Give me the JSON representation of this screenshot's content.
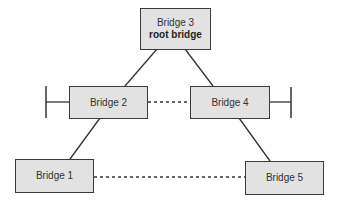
{
  "diagram": {
    "type": "spanning-tree-topology",
    "colors": {
      "box_fill": "#e2e2e2",
      "line": "#333333",
      "background": "#ffffff"
    },
    "nodes": [
      {
        "id": "bridge3",
        "label": "Bridge 3",
        "sublabel": "root bridge"
      },
      {
        "id": "bridge2",
        "label": "Bridge 2"
      },
      {
        "id": "bridge4",
        "label": "Bridge 4"
      },
      {
        "id": "bridge1",
        "label": "Bridge 1"
      },
      {
        "id": "bridge5",
        "label": "Bridge 5"
      }
    ],
    "edges": [
      {
        "from": "bridge3",
        "to": "bridge2",
        "style": "solid"
      },
      {
        "from": "bridge3",
        "to": "bridge4",
        "style": "solid"
      },
      {
        "from": "bridge2",
        "to": "bridge4",
        "style": "dashed"
      },
      {
        "from": "bridge2",
        "to": "bridge1",
        "style": "solid"
      },
      {
        "from": "bridge4",
        "to": "bridge5",
        "style": "solid"
      },
      {
        "from": "bridge1",
        "to": "bridge5",
        "style": "dashed"
      }
    ],
    "segments": [
      {
        "attached_to": "bridge2",
        "side": "left"
      },
      {
        "attached_to": "bridge4",
        "side": "right"
      }
    ]
  }
}
